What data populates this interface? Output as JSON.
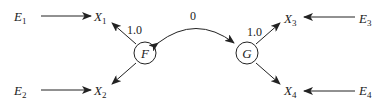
{
  "diagram": {
    "type": "path-diagram",
    "factors": [
      {
        "id": "F",
        "label": "F"
      },
      {
        "id": "G",
        "label": "G"
      }
    ],
    "observed": [
      {
        "id": "X1",
        "base": "X",
        "sub": "1"
      },
      {
        "id": "X2",
        "base": "X",
        "sub": "2"
      },
      {
        "id": "X3",
        "base": "X",
        "sub": "3"
      },
      {
        "id": "X4",
        "base": "X",
        "sub": "4"
      }
    ],
    "errors": [
      {
        "id": "E1",
        "base": "E",
        "sub": "1"
      },
      {
        "id": "E2",
        "base": "E",
        "sub": "2"
      },
      {
        "id": "E3",
        "base": "E",
        "sub": "3"
      },
      {
        "id": "E4",
        "base": "E",
        "sub": "4"
      }
    ],
    "edges": [
      {
        "from": "E1",
        "to": "X1"
      },
      {
        "from": "E2",
        "to": "X2"
      },
      {
        "from": "E3",
        "to": "X3"
      },
      {
        "from": "E4",
        "to": "X4"
      },
      {
        "from": "F",
        "to": "X1",
        "label": "1.0"
      },
      {
        "from": "F",
        "to": "X2"
      },
      {
        "from": "G",
        "to": "X3",
        "label": "1.0"
      },
      {
        "from": "G",
        "to": "X4"
      }
    ],
    "covariance": {
      "between": [
        "F",
        "G"
      ],
      "label": "0"
    }
  },
  "colors": {
    "stroke": "#222222",
    "background": "#ffffff"
  }
}
